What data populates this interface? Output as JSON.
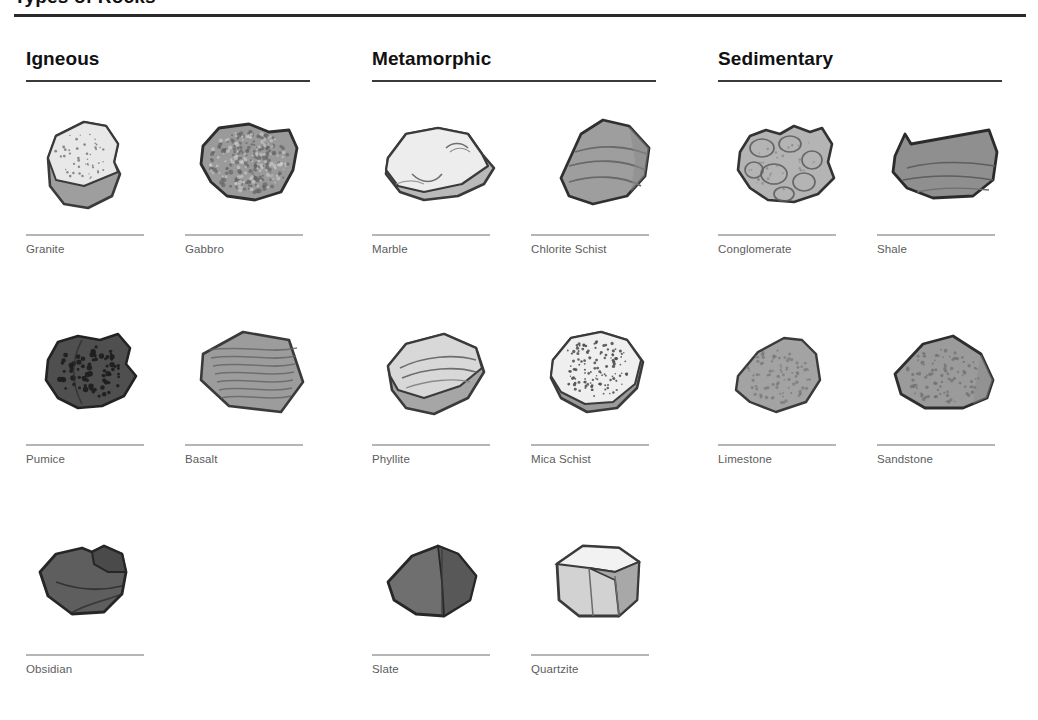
{
  "document": {
    "title": "Types of Rocks",
    "title_visible_note": "cropped at top edge"
  },
  "columns": [
    {
      "id": "igneous",
      "header": "Igneous",
      "rocks": [
        {
          "name": "Granite",
          "art": "granite",
          "body": "#e8e8e8",
          "shade": "#9e9e9e",
          "stroke": "#3a3a3a",
          "texture": "speckle-fine"
        },
        {
          "name": "Gabbro",
          "art": "gabbro",
          "body": "#9a9a9a",
          "shade": "#7a7a7a",
          "stroke": "#2e2e2e",
          "texture": "mottled-coarse"
        },
        {
          "name": "Pumice",
          "art": "pumice",
          "body": "#4f4f4f",
          "shade": "#3b3b3b",
          "stroke": "#232323",
          "texture": "vesicles"
        },
        {
          "name": "Basalt",
          "art": "basalt",
          "body": "#9c9c9c",
          "shade": "#828282",
          "stroke": "#3a3a3a",
          "texture": "striations"
        },
        {
          "name": "Obsidian",
          "art": "obsidian",
          "body": "#5e5e5e",
          "shade": "#4a4a4a",
          "stroke": "#262626",
          "texture": "conchoidal"
        }
      ]
    },
    {
      "id": "metamorphic",
      "header": "Metamorphic",
      "rocks": [
        {
          "name": "Marble",
          "art": "marble",
          "body": "#ededed",
          "shade": "#b9b9b9",
          "stroke": "#3a3a3a",
          "texture": "swirls"
        },
        {
          "name": "Chlorite Schist",
          "art": "chlorite",
          "body": "#9e9e9e",
          "shade": "#848484",
          "stroke": "#303030",
          "texture": "foliation"
        },
        {
          "name": "Phyllite",
          "art": "phyllite",
          "body": "#d8d8d8",
          "shade": "#a6a6a6",
          "stroke": "#3a3a3a",
          "texture": "wavy-layers"
        },
        {
          "name": "Mica Schist",
          "art": "micaschist",
          "body": "#efefef",
          "shade": "#9a9a9a",
          "stroke": "#3a3a3a",
          "texture": "flecks"
        },
        {
          "name": "Slate",
          "art": "slate",
          "body": "#6f6f6f",
          "shade": "#585858",
          "stroke": "#272727",
          "texture": "cleavage"
        },
        {
          "name": "Quartzite",
          "art": "quartzite",
          "body": "#d2d2d2",
          "shade": "#a8a8a8",
          "stroke": "#3a3a3a",
          "texture": "facets"
        }
      ]
    },
    {
      "id": "sedimentary",
      "header": "Sedimentary",
      "rocks": [
        {
          "name": "Conglomerate",
          "art": "conglomerate",
          "body": "#b4b4b4",
          "shade": "#949494",
          "stroke": "#333333",
          "texture": "pebbles"
        },
        {
          "name": "Shale",
          "art": "shale",
          "body": "#8f8f8f",
          "shade": "#757575",
          "stroke": "#2b2b2b",
          "texture": "layers"
        },
        {
          "name": "Limestone",
          "art": "limestone",
          "body": "#a3a3a3",
          "shade": "#8a8a8a",
          "stroke": "#3a3a3a",
          "texture": "grain"
        },
        {
          "name": "Sandstone",
          "art": "sandstone",
          "body": "#9b9b9b",
          "shade": "#818181",
          "stroke": "#2e2e2e",
          "texture": "grain"
        }
      ]
    }
  ],
  "palette": {
    "background": "#ffffff",
    "title_rule": "#2a2a2a",
    "column_rule": "#3a3a3a",
    "item_rule": "#b5b5b5",
    "label_text": "#5c5c5c",
    "header_text": "#111111"
  }
}
